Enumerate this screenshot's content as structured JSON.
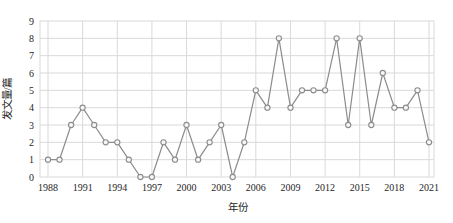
{
  "chart_data": {
    "type": "line",
    "title": "",
    "xlabel": "年份",
    "ylabel": "发文量/篇",
    "x": [
      1988,
      1989,
      1990,
      1991,
      1992,
      1993,
      1994,
      1995,
      1996,
      1997,
      1998,
      1999,
      2000,
      2001,
      2002,
      2003,
      2004,
      2005,
      2006,
      2007,
      2008,
      2009,
      2010,
      2011,
      2012,
      2013,
      2014,
      2015,
      2016,
      2017,
      2018,
      2019,
      2020,
      2021
    ],
    "values": [
      1,
      1,
      3,
      4,
      3,
      2,
      2,
      1,
      0,
      0,
      2,
      1,
      3,
      1,
      2,
      3,
      0,
      2,
      5,
      4,
      8,
      4,
      5,
      5,
      5,
      8,
      3,
      8,
      3,
      6,
      4,
      4,
      5,
      2
    ],
    "xtick_labels": [
      "1988",
      "1991",
      "1994",
      "1997",
      "2000",
      "2003",
      "2006",
      "2009",
      "2012",
      "2015",
      "2018",
      "2021"
    ],
    "ytick_labels": [
      "0",
      "1",
      "2",
      "3",
      "4",
      "5",
      "6",
      "7",
      "8",
      "9"
    ],
    "ylim": [
      0,
      9
    ],
    "xtick_interval_years": 3,
    "grid": true,
    "legend": "none",
    "colors": {
      "line": "#8c8c8c",
      "marker_stroke": "#8c8c8c",
      "marker_fill": "#f7f7f7",
      "grid": "#d9d9d9",
      "text": "#262626",
      "background": "#ffffff"
    }
  }
}
